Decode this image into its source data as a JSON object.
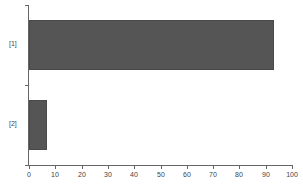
{
  "chart_data": {
    "type": "bar",
    "orientation": "horizontal",
    "title": "",
    "xlabel": "",
    "ylabel": "",
    "categories": [
      "[1]",
      "[2]"
    ],
    "values": [
      93,
      7
    ],
    "xlim": [
      0,
      100
    ],
    "x_ticks": [
      "0",
      "10",
      "20",
      "30",
      "40",
      "50",
      "60",
      "70",
      "80",
      "90",
      "100"
    ],
    "grid": false,
    "legend": null,
    "bar_color": "#555555"
  }
}
